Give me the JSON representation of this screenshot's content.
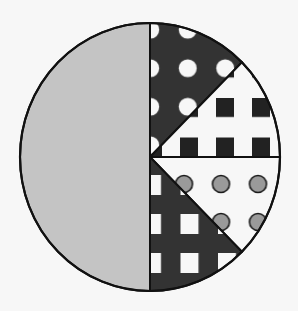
{
  "chart_data": {
    "type": "pie",
    "title": "",
    "center": [
      150,
      157
    ],
    "radius": [
      130,
      134
    ],
    "start_angle_deg": -90,
    "direction": "clockwise",
    "slices": [
      {
        "label": "",
        "value": 12.5,
        "fill": "dark-with-white-dots",
        "bg": "#333333",
        "fg": "#f7f7f7"
      },
      {
        "label": "",
        "value": 12.5,
        "fill": "white-with-black-squares",
        "bg": "#f7f7f7",
        "fg": "#222222"
      },
      {
        "label": "",
        "value": 12.5,
        "fill": "white-with-gray-circles",
        "bg": "#f7f7f7",
        "fg": "#9a9a9a"
      },
      {
        "label": "",
        "value": 12.5,
        "fill": "dark-grid-with-white-squares",
        "bg": "#333333",
        "fg": "#f7f7f7"
      },
      {
        "label": "",
        "value": 50,
        "fill": "solid-light-gray",
        "bg": "#c4c4c4",
        "fg": "#c4c4c4"
      }
    ],
    "legend": null,
    "outline_color": "#111111"
  }
}
